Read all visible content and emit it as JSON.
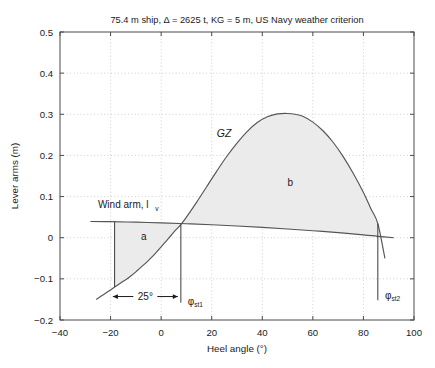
{
  "chart_data": {
    "type": "line",
    "title": "75.4 m ship, Δ = 2625 t, KG = 5 m, US Navy weather criterion",
    "xlabel": "Heel angle (°)",
    "ylabel": "Lever arms (m)",
    "xlim": [
      -40,
      100
    ],
    "ylim": [
      -0.2,
      0.5
    ],
    "xticks": [
      "-40",
      "-20",
      "0",
      "20",
      "40",
      "60",
      "80",
      "100"
    ],
    "xtick_values": [
      -40,
      -20,
      0,
      20,
      40,
      60,
      80,
      100
    ],
    "yticks": [
      "0.5",
      "0.4",
      "0.3",
      "0.2",
      "0.1",
      "0",
      "-0.1",
      "-0.2"
    ],
    "ytick_values": [
      0.5,
      0.4,
      0.3,
      0.2,
      0.1,
      0,
      -0.1,
      -0.2
    ],
    "grid": true,
    "legend_position": "none",
    "series": [
      {
        "name": "GZ",
        "label": "GZ",
        "comment": "righting lever curve, zero crossing near -25.7 deg at bottom start and decreasing after peak",
        "x": [
          -25.7,
          -24,
          -22,
          -20,
          -18.4,
          -16,
          -14,
          -12,
          -10,
          -8,
          -6,
          -4,
          -2,
          0,
          2,
          4,
          6,
          7.8,
          10,
          14,
          18,
          22,
          26,
          30,
          34,
          38,
          42,
          46,
          50,
          53,
          56,
          60,
          64,
          68,
          72,
          76,
          80,
          83,
          85.7,
          88.5
        ],
        "y": [
          -0.15,
          -0.143,
          -0.135,
          -0.127,
          -0.12,
          -0.11,
          -0.102,
          -0.093,
          -0.083,
          -0.072,
          -0.061,
          -0.049,
          -0.036,
          -0.022,
          -0.008,
          0.006,
          0.02,
          0.032,
          0.05,
          0.086,
          0.124,
          0.162,
          0.198,
          0.23,
          0.258,
          0.28,
          0.294,
          0.301,
          0.302,
          0.3,
          0.295,
          0.281,
          0.26,
          0.232,
          0.197,
          0.156,
          0.11,
          0.07,
          0.034,
          -0.05
        ]
      },
      {
        "name": "Wind arm, lv",
        "label": "Wind arm, l",
        "label_sub": "v",
        "comment": "heeling (wind) arm, gently decreasing cosine-like line",
        "x": [
          -28,
          -20,
          -10,
          0,
          10,
          20,
          30,
          40,
          50,
          60,
          70,
          80,
          85.7,
          92
        ],
        "y": [
          0.0395,
          0.039,
          0.0378,
          0.036,
          0.034,
          0.0315,
          0.0285,
          0.025,
          0.0212,
          0.017,
          0.0124,
          0.007,
          0.0034,
          0.0
        ]
      }
    ],
    "annotations": [
      {
        "name": "gz-label",
        "text": "GZ",
        "x": 22,
        "y": 0.245,
        "style": "italic"
      },
      {
        "name": "wind-arm-label",
        "text": "Wind arm, l",
        "sub": "v",
        "x": -25,
        "y": 0.072
      },
      {
        "name": "area-a-label",
        "text": "a",
        "x": -8,
        "y": -0.005
      },
      {
        "name": "area-b-label",
        "text": "b",
        "x": 50,
        "y": 0.125
      },
      {
        "name": "dimension-25deg",
        "text": "25°",
        "from_x": -19.1,
        "to_x": 6.6,
        "y": -0.143
      },
      {
        "name": "phi-st1-label",
        "text": "φ",
        "sub": "st1",
        "x": 10.5,
        "y": -0.163
      },
      {
        "name": "phi-st2-label",
        "text": "φ",
        "sub": "st2",
        "x": 88.5,
        "y": -0.148
      }
    ],
    "vertical_lines": [
      {
        "name": "phi-st1-line",
        "x": 7.8,
        "y_from": 0.032,
        "y_to": -0.158
      },
      {
        "name": "phi-st2-line",
        "x": 85.7,
        "y_from": 0.034,
        "y_to": -0.152
      },
      {
        "name": "area-a-left-line",
        "x": -18.4,
        "y_from": 0.0385,
        "y_to": -0.12
      }
    ],
    "shaded_regions": [
      {
        "name": "area-a",
        "label": "a",
        "from_x": -18.4,
        "to_x": 7.8,
        "between": [
          "Wind arm, lv",
          "GZ"
        ]
      },
      {
        "name": "area-b",
        "label": "b",
        "from_x": 7.8,
        "to_x": 85.7,
        "between": [
          "GZ",
          "Wind arm, lv"
        ]
      }
    ],
    "colors": {
      "curve": "#555555",
      "fill": "#ebebeb",
      "grid": "#bbbbbb",
      "frame": "#4a4a4a",
      "text": "#1a1a1a"
    }
  }
}
